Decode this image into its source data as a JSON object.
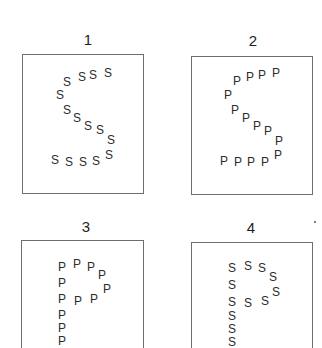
{
  "figure": {
    "panels": [
      {
        "label": "1",
        "global_letter": "S",
        "local_letter": "S",
        "label_pos": [
          88,
          39
        ],
        "box": {
          "left": 22,
          "top": 54,
          "width": 122,
          "height": 140,
          "open_bottom": false
        },
        "positions": [
          [
            67,
            82
          ],
          [
            82,
            77
          ],
          [
            93,
            75
          ],
          [
            108,
            73
          ],
          [
            60,
            95
          ],
          [
            67,
            110
          ],
          [
            77,
            118
          ],
          [
            88,
            126
          ],
          [
            100,
            130
          ],
          [
            111,
            140
          ],
          [
            55,
            160
          ],
          [
            69,
            162
          ],
          [
            83,
            162
          ],
          [
            96,
            161
          ],
          [
            109,
            155
          ]
        ]
      },
      {
        "label": "2",
        "global_letter": "S",
        "local_letter": "P",
        "label_pos": [
          253,
          40
        ],
        "box": {
          "left": 191,
          "top": 56,
          "width": 122,
          "height": 139,
          "open_bottom": false
        },
        "positions": [
          [
            237,
            81
          ],
          [
            250,
            77
          ],
          [
            262,
            75
          ],
          [
            276,
            73
          ],
          [
            228,
            95
          ],
          [
            235,
            110
          ],
          [
            246,
            118
          ],
          [
            257,
            126
          ],
          [
            268,
            131
          ],
          [
            279,
            141
          ],
          [
            224,
            161
          ],
          [
            238,
            162
          ],
          [
            251,
            162
          ],
          [
            265,
            162
          ],
          [
            278,
            155
          ]
        ]
      },
      {
        "label": "3",
        "global_letter": "P",
        "local_letter": "P",
        "label_pos": [
          86,
          226
        ],
        "box": {
          "left": 21,
          "top": 240,
          "width": 123,
          "height": 108,
          "open_bottom": true
        },
        "positions": [
          [
            62,
            267
          ],
          [
            77,
            264
          ],
          [
            91,
            267
          ],
          [
            102,
            275
          ],
          [
            62,
            283
          ],
          [
            62,
            299
          ],
          [
            78,
            301
          ],
          [
            94,
            299
          ],
          [
            107,
            289
          ],
          [
            62,
            315
          ],
          [
            62,
            328
          ],
          [
            62,
            341
          ]
        ]
      },
      {
        "label": "4",
        "global_letter": "P",
        "local_letter": "S",
        "label_pos": [
          251,
          227
        ],
        "box": {
          "left": 191,
          "top": 242,
          "width": 122,
          "height": 106,
          "open_bottom": true
        },
        "positions": [
          [
            232,
            268
          ],
          [
            248,
            266
          ],
          [
            262,
            268
          ],
          [
            273,
            277
          ],
          [
            232,
            285
          ],
          [
            232,
            302
          ],
          [
            248,
            303
          ],
          [
            265,
            301
          ],
          [
            276,
            292
          ],
          [
            232,
            316
          ],
          [
            232,
            329
          ],
          [
            232,
            342
          ]
        ]
      }
    ],
    "stray_mark": {
      "x": 314,
      "y": 221
    }
  }
}
